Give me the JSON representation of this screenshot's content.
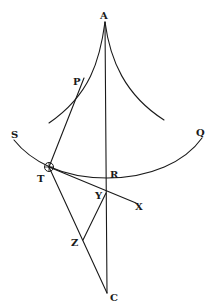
{
  "diagram": {
    "type": "geometric-figure",
    "points": {
      "A": "A",
      "P": "P",
      "S": "S",
      "Q": "Q",
      "T": "T",
      "R": "R",
      "Y": "Y",
      "X": "X",
      "Z": "Z",
      "C": "C"
    },
    "curves": [
      {
        "name": "left-cusp-branch",
        "from": "A",
        "via": "P"
      },
      {
        "name": "right-cusp-branch",
        "from": "A"
      },
      {
        "name": "arc-SQ",
        "from": "S",
        "via": [
          "T",
          "R"
        ],
        "to": "Q"
      }
    ],
    "lines": [
      {
        "name": "line-AC",
        "from": "A",
        "via": [
          "R",
          "Y"
        ],
        "to": "C"
      },
      {
        "name": "line-TP",
        "from": "T",
        "to": "P"
      },
      {
        "name": "line-TX",
        "from": "T",
        "via": "Y",
        "to": "X"
      },
      {
        "name": "line-TC",
        "from": "T",
        "via": "Z",
        "to": "C"
      },
      {
        "name": "line-ZY",
        "from": "Z",
        "to": "Y"
      }
    ],
    "marked_point": "T"
  }
}
